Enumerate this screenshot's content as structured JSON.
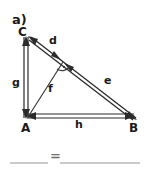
{
  "figure": {
    "part_label": "a)",
    "vertices": [
      {
        "name": "C",
        "label": "C",
        "x": 28,
        "y": 36
      },
      {
        "name": "A",
        "label": "A",
        "x": 28,
        "y": 117
      },
      {
        "name": "B",
        "label": "B",
        "x": 133,
        "y": 117
      },
      {
        "name": "F",
        "label": "",
        "x": 62,
        "y": 62
      }
    ],
    "segments": [
      {
        "name": "d",
        "label": "d",
        "from": "C",
        "to": "F",
        "label_x": 52,
        "label_y": 43
      },
      {
        "name": "e",
        "label": "e",
        "from": "F",
        "to": "B",
        "label_x": 107,
        "label_y": 83
      },
      {
        "name": "f",
        "label": "f",
        "from": "A",
        "to": "F",
        "label_x": 51,
        "label_y": 91
      },
      {
        "name": "g",
        "label": "g",
        "from": "A",
        "to": "C",
        "label_x": 15,
        "label_y": 82
      },
      {
        "name": "h",
        "label": "h",
        "from": "A",
        "to": "B",
        "label_x": 78,
        "label_y": 127
      }
    ],
    "right_angle": {
      "at": "F",
      "marker": "right-angle-arc-dot"
    },
    "colors": {
      "line": "#2b2b2b",
      "text": "#1a1a1a",
      "blank": "#b8b8b8",
      "equals": "#6f6f6f",
      "background": "#ffffff"
    }
  },
  "answer_row": {
    "equals_symbol": "=",
    "blanks": [
      {
        "name": "blank-left",
        "x1": 10,
        "x2": 48,
        "y": 163
      },
      {
        "name": "blank-right",
        "x1": 60,
        "x2": 140,
        "y": 163
      }
    ]
  }
}
